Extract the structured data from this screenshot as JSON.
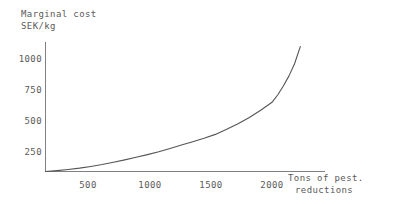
{
  "chart_data": {
    "type": "line",
    "title": "",
    "ylabel": "Marginal cost SEK/kg",
    "ylabel_lines": [
      "Marginal cost",
      "SEK/kg"
    ],
    "xlabel": "Tons of pest. reductions",
    "xlabel_lines": [
      "Tons of pest.",
      "reductions"
    ],
    "xticks": [
      "500",
      "1000",
      "1500",
      "2000"
    ],
    "xtick_values": [
      500,
      1000,
      1500,
      2000
    ],
    "yticks": [
      "250",
      "500",
      "750",
      "1000"
    ],
    "ytick_values": [
      250,
      500,
      750,
      1000
    ],
    "xlim": [
      0,
      2300
    ],
    "ylim": [
      0,
      1150
    ],
    "grid": false,
    "legend": false,
    "series": [
      {
        "name": "Marginal cost",
        "x": [
          0,
          100,
          200,
          300,
          400,
          500,
          600,
          700,
          800,
          900,
          1000,
          1100,
          1200,
          1300,
          1400,
          1500,
          1600,
          1700,
          1800,
          1900,
          2000,
          2050,
          2100,
          2150,
          2200,
          2250
        ],
        "y": [
          0,
          8,
          18,
          30,
          45,
          62,
          82,
          103,
          126,
          150,
          176,
          205,
          235,
          265,
          295,
          330,
          375,
          425,
          480,
          545,
          615,
          680,
          760,
          850,
          960,
          1110
        ]
      }
    ],
    "line_color": "#555555",
    "axis_color": "#808080",
    "text_color": "#5a5a5a"
  }
}
